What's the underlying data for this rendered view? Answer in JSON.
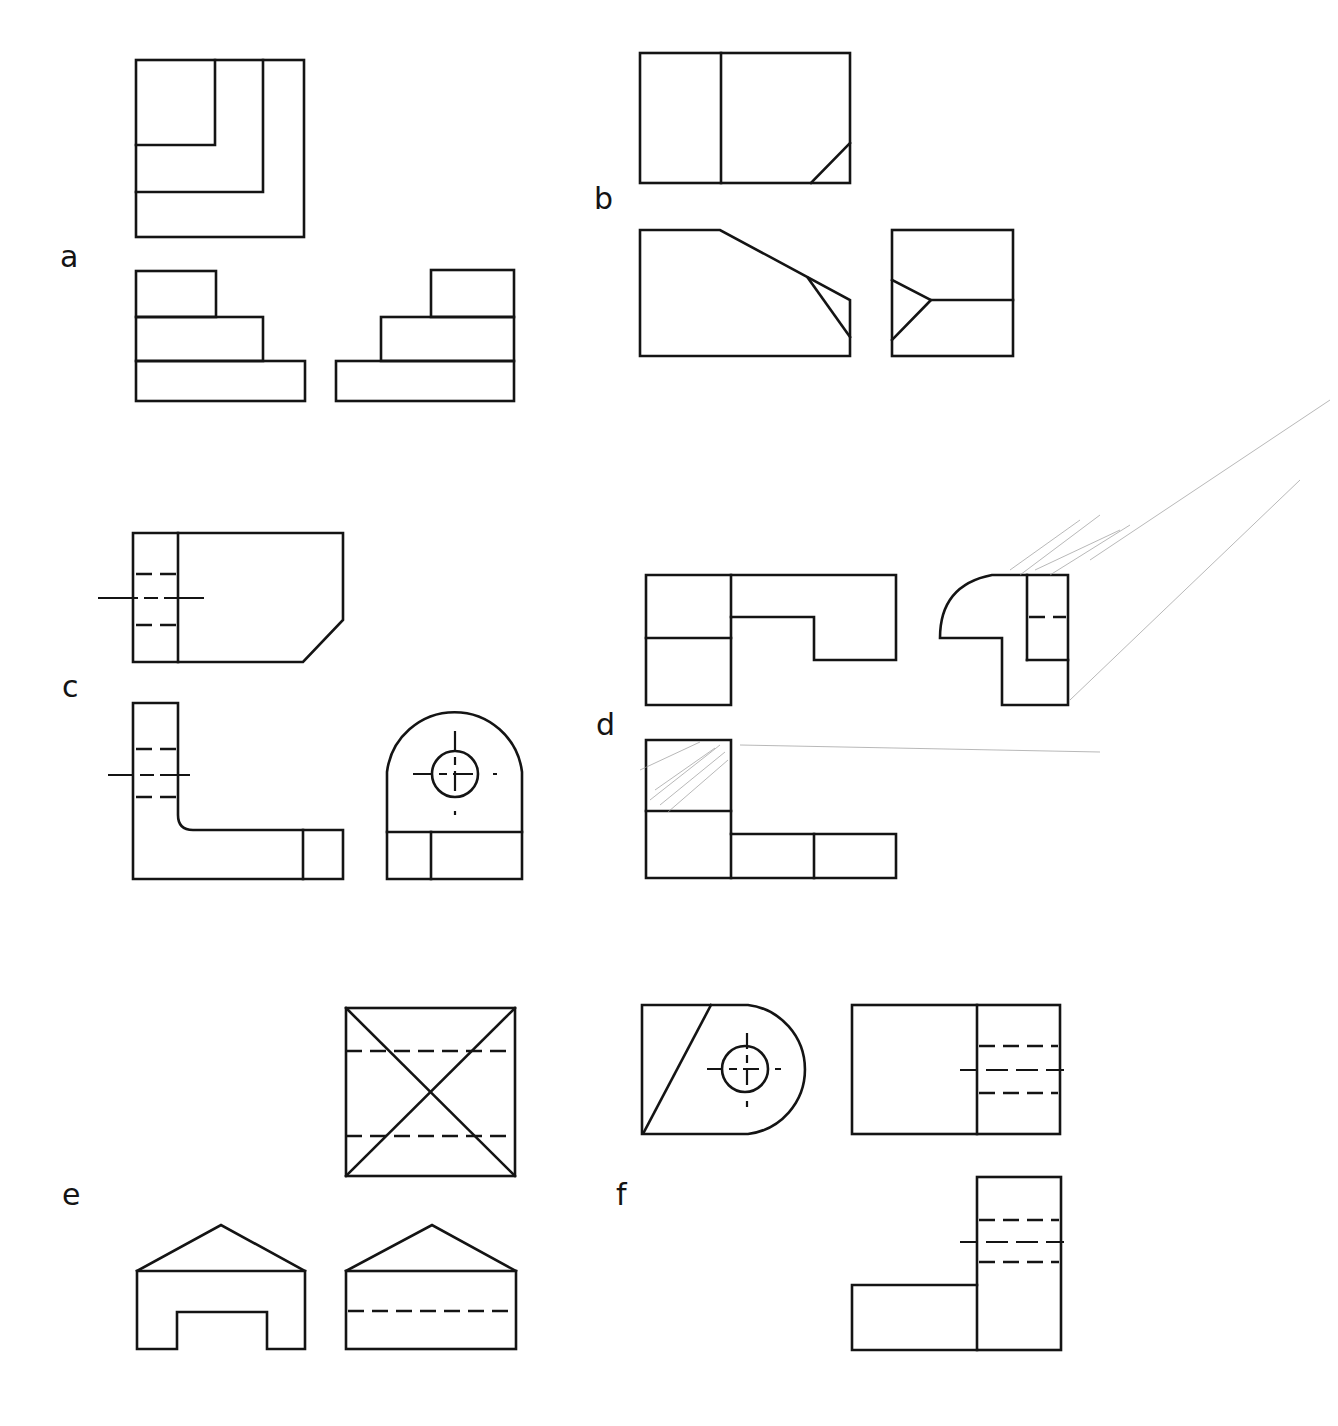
{
  "figure": {
    "background": "#ffffff",
    "line_color": "#141414",
    "problems": [
      {
        "id": "a",
        "label": "a",
        "views": [
          "top-view",
          "front-view",
          "side-view"
        ]
      },
      {
        "id": "b",
        "label": "b",
        "views": [
          "top-view",
          "front-view",
          "side-view"
        ]
      },
      {
        "id": "c",
        "label": "c",
        "views": [
          "top-view",
          "front-view",
          "side-view"
        ]
      },
      {
        "id": "d",
        "label": "d",
        "views": [
          "front-view",
          "side-view",
          "bottom-view"
        ]
      },
      {
        "id": "e",
        "label": "e",
        "views": [
          "top-view",
          "front-view",
          "side-view"
        ]
      },
      {
        "id": "f",
        "label": "f",
        "views": [
          "front-view",
          "side-view",
          "bottom-view"
        ]
      }
    ]
  }
}
